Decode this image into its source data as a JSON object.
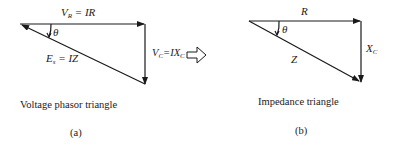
{
  "panel_a": {
    "top_label_main": "V",
    "top_label_sub": "R",
    "top_label_rest": " = IR",
    "theta": "θ",
    "hyp_label_main": "E",
    "hyp_label_sub": "s",
    "hyp_label_rest": " = IZ",
    "right_label_main": "V",
    "right_label_sub": "C",
    "right_label_rest": "=IX",
    "right_label_sub2": "C",
    "caption": "Voltage phasor triangle",
    "sublabel": "(a)"
  },
  "panel_b": {
    "top_label": "R",
    "theta": "θ",
    "hyp_label": "Z",
    "right_label_main": "X",
    "right_label_sub": "C",
    "caption": "Impedance triangle",
    "sublabel": "(b)"
  },
  "colors": {
    "line": "#1a1a1a",
    "background": "#ffffff"
  }
}
